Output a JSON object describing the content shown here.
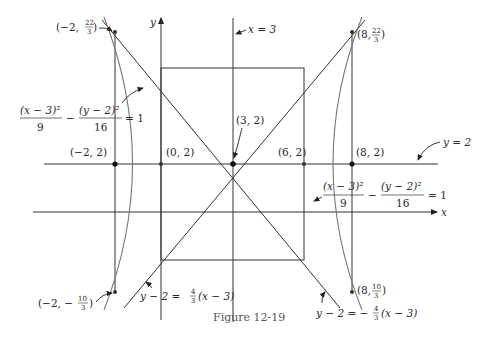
{
  "figure": {
    "caption": "Figure 12-19",
    "axes": {
      "x_label": "x",
      "y_label": "y"
    },
    "lines": {
      "vertical_center": "x = 3",
      "horizontal_center": "y = 2"
    },
    "equations": {
      "hyperbola_left": {
        "num1": "(x − 3)²",
        "den1": "9",
        "minus": "−",
        "num2": "(y − 2)²",
        "den2": "16",
        "rhs": "= 1"
      },
      "hyperbola_right": {
        "num1": "(x − 3)²",
        "den1": "9",
        "minus": "−",
        "num2": "(y − 2)²",
        "den2": "16",
        "rhs": "= 1"
      },
      "asymptote_pos": {
        "lhs": "y − 2 = ",
        "frac_num": "4",
        "frac_den": "3",
        "rhs": "(x − 3)"
      },
      "asymptote_neg": {
        "lhs": "y − 2 = −",
        "frac_num": "4",
        "frac_den": "3",
        "rhs": "(x − 3)"
      }
    },
    "points": {
      "p_m2_top": {
        "pre": "(−2, ",
        "num": "22",
        "den": "3",
        "post": ")"
      },
      "p_8_top": {
        "pre": "(8, ",
        "num": "22",
        "den": "3",
        "post": ")"
      },
      "p_m2_2": "(−2, 2)",
      "p_0_2": "(0, 2)",
      "p_3_2": "(3, 2)",
      "p_6_2": "(6, 2)",
      "p_8_2": "(8, 2)",
      "p_m2_bot": {
        "pre": "(−2, −",
        "num": "10",
        "den": "3",
        "post": ")"
      },
      "p_8_bot": {
        "pre": "(8, ",
        "num": "10",
        "den": "3",
        "post": ")"
      }
    }
  }
}
